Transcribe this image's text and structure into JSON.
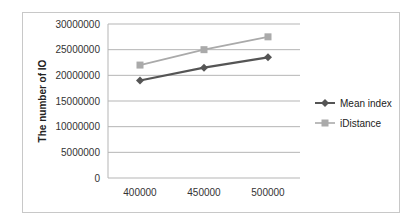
{
  "chart_data": {
    "type": "line",
    "title": "",
    "xlabel": "",
    "ylabel": "The number of IO",
    "categories": [
      "400000",
      "450000",
      "500000"
    ],
    "x": [
      400000,
      450000,
      500000
    ],
    "series": [
      {
        "name": "Mean index",
        "values": [
          19000000,
          21500000,
          23500000
        ],
        "color": "#555555",
        "marker": "diamond"
      },
      {
        "name": "iDistance",
        "values": [
          22000000,
          25000000,
          27500000
        ],
        "color": "#aaaaaa",
        "marker": "square"
      }
    ],
    "ylim": [
      0,
      30000000
    ],
    "yticks": [
      0,
      5000000,
      10000000,
      15000000,
      20000000,
      25000000,
      30000000
    ],
    "ytick_labels": [
      "0",
      "5000000",
      "10000000",
      "15000000",
      "20000000",
      "25000000",
      "30000000"
    ],
    "grid": true,
    "legend_position": "right"
  }
}
